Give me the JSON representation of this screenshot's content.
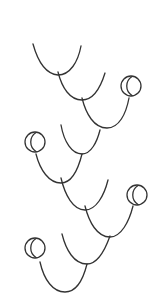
{
  "diagram": {
    "width": 159,
    "height": 308,
    "background": "#ffffff",
    "stroke_color": "#333333",
    "stroke_width": 1.3,
    "curves": [
      {
        "id": "u1",
        "d": "M33,44 C38,62 46,74 58,75 C70,75 78,62 81,46"
      },
      {
        "id": "u2",
        "d": "M58,72 C62,88 70,100 82,100 C94,100 101,86 105,73"
      },
      {
        "id": "u3",
        "d": "M82,98 C86,114 94,128 107,128 C119,128 126,114 129,98"
      },
      {
        "id": "u4",
        "d": "M61,125 C64,142 72,154 82,154 C91,154 97,142 100,130"
      },
      {
        "id": "u5",
        "d": "M36,154 C40,170 49,183 61,183 C72,183 78,170 82,154"
      },
      {
        "id": "u6",
        "d": "M61,178 C65,195 73,210 85,210 C96,210 104,196 108,180"
      },
      {
        "id": "u7",
        "d": "M85,206 C89,222 97,237 110,237 C121,237 129,222 133,206"
      },
      {
        "id": "u8",
        "d": "M62,234 C66,250 74,264 87,264 C98,264 105,250 110,236"
      },
      {
        "id": "u9",
        "d": "M40,262 C44,280 53,292 65,292 C76,292 83,280 87,264"
      }
    ],
    "crescents": [
      {
        "id": "c1",
        "cx": 131,
        "cy": 86,
        "r": 10
      },
      {
        "id": "c2",
        "cx": 35,
        "cy": 142,
        "r": 10
      },
      {
        "id": "c3",
        "cx": 137,
        "cy": 195,
        "r": 10
      },
      {
        "id": "c4",
        "cx": 35,
        "cy": 248,
        "r": 10
      }
    ]
  }
}
